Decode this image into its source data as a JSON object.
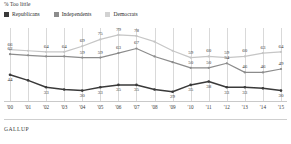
{
  "chart_data": {
    "type": "line",
    "title": "% Too little",
    "xlabel": "",
    "ylabel": "",
    "ylim": [
      20,
      85
    ],
    "grid": true,
    "legend_position": "top-left",
    "x": [
      "'00",
      "'01",
      "'02",
      "'03",
      "'04",
      "'05",
      "'06",
      "'07",
      "'08",
      "'09",
      "'10",
      "'11",
      "'12",
      "'13",
      "'14",
      "'15"
    ],
    "series": [
      {
        "name": "Republicans",
        "color": "#3a3a3a",
        "values": [
          44,
          39,
          33,
          31,
          30,
          33,
          35,
          35,
          31,
          29,
          35,
          38,
          33,
          33,
          32,
          30
        ],
        "labels": [
          "44",
          "",
          "33",
          "",
          "30",
          "33",
          "35",
          "35",
          "",
          "29",
          "35",
          "38",
          "33",
          "33",
          "",
          "30"
        ]
      },
      {
        "name": "Independents",
        "color": "#8c8c8c",
        "values": [
          62,
          61,
          60,
          60,
          59,
          59,
          63,
          67,
          60,
          55,
          50,
          50,
          54,
          46,
          46,
          49
        ],
        "labels": [
          "62",
          "",
          "",
          "",
          "59",
          "59",
          "63",
          "67",
          "",
          "",
          "50",
          "50",
          "54",
          "46",
          "46",
          "49"
        ]
      },
      {
        "name": "Democrats",
        "color": "#c6c6c6",
        "values": [
          66,
          65,
          64,
          64,
          69,
          75,
          79,
          78,
          73,
          65,
          59,
          60,
          59,
          60,
          63,
          64
        ],
        "labels": [
          "66",
          "",
          "64",
          "64",
          "69",
          "75",
          "79",
          "78",
          "",
          "",
          "59",
          "60",
          "59",
          "60",
          "63",
          "64"
        ]
      }
    ]
  },
  "legend": {
    "items": [
      {
        "label": "Republicans",
        "color": "#3a3a3a"
      },
      {
        "label": "Independents",
        "color": "#8c8c8c"
      },
      {
        "label": "Democrats",
        "color": "#c6c6c6"
      }
    ]
  },
  "footer": {
    "brand": "GALLUP"
  }
}
